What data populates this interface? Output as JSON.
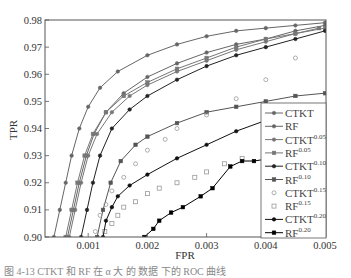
{
  "chart_data": {
    "type": "line",
    "title": "",
    "xlabel": "FPR",
    "ylabel": "TPR",
    "xlim": [
      0.00027,
      0.005
    ],
    "ylim": [
      0.9,
      0.98
    ],
    "grid": false,
    "legend_position": "lower right",
    "x_ticks": [
      "0.001",
      "0.002",
      "0.003",
      "0.004",
      "0.005"
    ],
    "x_tick_values": [
      0.001,
      0.002,
      0.003,
      0.004,
      0.005
    ],
    "y_ticks": [
      "0.90",
      "0.91",
      "0.92",
      "0.93",
      "0.94",
      "0.95",
      "0.96",
      "0.97",
      "0.98"
    ],
    "y_tick_values": [
      0.9,
      0.91,
      0.92,
      0.93,
      0.94,
      0.95,
      0.96,
      0.97,
      0.98
    ],
    "series": [
      {
        "name": "CTKT",
        "sup": "",
        "color": "#666666",
        "marker": "circle",
        "filled": true,
        "line": true,
        "points": [
          [
            0.00042,
            0.9
          ],
          [
            0.00052,
            0.91
          ],
          [
            0.00062,
            0.92
          ],
          [
            0.00072,
            0.93
          ],
          [
            0.00085,
            0.94
          ],
          [
            0.001,
            0.948
          ],
          [
            0.0012,
            0.955
          ],
          [
            0.0015,
            0.961
          ],
          [
            0.002,
            0.967
          ],
          [
            0.0025,
            0.971
          ],
          [
            0.003,
            0.974
          ],
          [
            0.0035,
            0.976
          ],
          [
            0.004,
            0.977
          ],
          [
            0.0045,
            0.978
          ],
          [
            0.005,
            0.979
          ]
        ]
      },
      {
        "name": "RF",
        "sup": "",
        "color": "#666666",
        "marker": "circle",
        "filled": true,
        "line": true,
        "points": [
          [
            0.00065,
            0.9
          ],
          [
            0.00075,
            0.91
          ],
          [
            0.00085,
            0.92
          ],
          [
            0.00097,
            0.93
          ],
          [
            0.0011,
            0.938
          ],
          [
            0.0013,
            0.946
          ],
          [
            0.0016,
            0.953
          ],
          [
            0.002,
            0.959
          ],
          [
            0.0025,
            0.964
          ],
          [
            0.003,
            0.968
          ],
          [
            0.0035,
            0.971
          ],
          [
            0.004,
            0.973
          ],
          [
            0.0045,
            0.976
          ],
          [
            0.005,
            0.978
          ]
        ]
      },
      {
        "name": "CTKT",
        "sup": "0.05",
        "color": "#777777",
        "marker": "circle",
        "filled": true,
        "line": true,
        "points": [
          [
            0.00068,
            0.9
          ],
          [
            0.00078,
            0.91
          ],
          [
            0.00088,
            0.92
          ],
          [
            0.001,
            0.93
          ],
          [
            0.00115,
            0.938
          ],
          [
            0.0014,
            0.946
          ],
          [
            0.0017,
            0.952
          ],
          [
            0.002,
            0.956
          ],
          [
            0.0025,
            0.961
          ],
          [
            0.003,
            0.965
          ],
          [
            0.0035,
            0.969
          ],
          [
            0.004,
            0.972
          ],
          [
            0.0045,
            0.975
          ],
          [
            0.005,
            0.977
          ]
        ]
      },
      {
        "name": "RF",
        "sup": "0.05",
        "color": "#777777",
        "marker": "square",
        "filled": true,
        "line": true,
        "points": [
          [
            0.00062,
            0.9
          ],
          [
            0.00072,
            0.91
          ],
          [
            0.00082,
            0.92
          ],
          [
            0.00094,
            0.93
          ],
          [
            0.00108,
            0.938
          ],
          [
            0.0013,
            0.946
          ],
          [
            0.0016,
            0.952
          ],
          [
            0.002,
            0.957
          ],
          [
            0.0025,
            0.962
          ],
          [
            0.003,
            0.966
          ],
          [
            0.0035,
            0.97
          ],
          [
            0.004,
            0.973
          ],
          [
            0.0045,
            0.975
          ],
          [
            0.0049,
            0.977
          ]
        ]
      },
      {
        "name": "CTKT",
        "sup": "0.10",
        "color": "#222222",
        "marker": "circle",
        "filled": true,
        "line": true,
        "points": [
          [
            0.00088,
            0.9
          ],
          [
            0.00098,
            0.91
          ],
          [
            0.00108,
            0.92
          ],
          [
            0.0012,
            0.93
          ],
          [
            0.0014,
            0.94
          ],
          [
            0.0017,
            0.947
          ],
          [
            0.002,
            0.952
          ],
          [
            0.0025,
            0.958
          ],
          [
            0.003,
            0.963
          ],
          [
            0.0035,
            0.967
          ],
          [
            0.004,
            0.97
          ],
          [
            0.0045,
            0.973
          ],
          [
            0.005,
            0.976
          ]
        ]
      },
      {
        "name": "RF",
        "sup": "0.10",
        "color": "#555555",
        "marker": "square",
        "filled": true,
        "line": true,
        "points": [
          [
            0.00115,
            0.9
          ],
          [
            0.00125,
            0.91
          ],
          [
            0.00138,
            0.92
          ],
          [
            0.00155,
            0.928
          ],
          [
            0.0018,
            0.934
          ],
          [
            0.002,
            0.937
          ],
          [
            0.0025,
            0.942
          ],
          [
            0.003,
            0.946
          ],
          [
            0.0035,
            0.948
          ],
          [
            0.004,
            0.95
          ],
          [
            0.0045,
            0.952
          ],
          [
            0.005,
            0.953
          ]
        ]
      },
      {
        "name": "CTKT",
        "sup": "0.15",
        "color": "#999999",
        "marker": "circle",
        "filled": false,
        "line": false,
        "points": [
          [
            0.00112,
            0.902
          ],
          [
            0.0012,
            0.908
          ],
          [
            0.0013,
            0.912
          ],
          [
            0.0014,
            0.917
          ],
          [
            0.0016,
            0.922
          ],
          [
            0.0018,
            0.927
          ],
          [
            0.002,
            0.932
          ],
          [
            0.0023,
            0.936
          ],
          [
            0.0025,
            0.94
          ],
          [
            0.003,
            0.945
          ],
          [
            0.0035,
            0.951
          ],
          [
            0.004,
            0.958
          ],
          [
            0.0045,
            0.966
          ]
        ]
      },
      {
        "name": "RF",
        "sup": "0.15",
        "color": "#999999",
        "marker": "square",
        "filled": false,
        "line": false,
        "points": [
          [
            0.00128,
            0.902
          ],
          [
            0.0014,
            0.905
          ],
          [
            0.0015,
            0.908
          ],
          [
            0.0016,
            0.911
          ],
          [
            0.0018,
            0.913
          ],
          [
            0.002,
            0.916
          ],
          [
            0.0022,
            0.918
          ],
          [
            0.0025,
            0.92
          ],
          [
            0.0028,
            0.922
          ],
          [
            0.003,
            0.924
          ],
          [
            0.0033,
            0.927
          ],
          [
            0.0036,
            0.929
          ],
          [
            0.004,
            0.931
          ],
          [
            0.0045,
            0.934
          ]
        ]
      },
      {
        "name": "CTKT",
        "sup": "0.20",
        "color": "#111111",
        "marker": "circle",
        "filled": true,
        "line": true,
        "points": [
          [
            0.00125,
            0.9
          ],
          [
            0.0013,
            0.906
          ],
          [
            0.0014,
            0.911
          ],
          [
            0.0015,
            0.915
          ],
          [
            0.0017,
            0.919
          ],
          [
            0.002,
            0.923
          ],
          [
            0.0025,
            0.929
          ],
          [
            0.003,
            0.934
          ],
          [
            0.0035,
            0.939
          ],
          [
            0.004,
            0.943
          ],
          [
            0.0045,
            0.946
          ],
          [
            0.005,
            0.948
          ]
        ]
      },
      {
        "name": "RF",
        "sup": "0.20",
        "color": "#000000",
        "marker": "square",
        "filled": true,
        "line": true,
        "points": [
          [
            0.00195,
            0.9
          ],
          [
            0.0021,
            0.903
          ],
          [
            0.0022,
            0.906
          ],
          [
            0.0024,
            0.909
          ],
          [
            0.0026,
            0.911
          ],
          [
            0.0029,
            0.915
          ],
          [
            0.0031,
            0.918
          ],
          [
            0.0034,
            0.926
          ],
          [
            0.0036,
            0.928
          ],
          [
            0.0038,
            0.928
          ],
          [
            0.0041,
            0.929
          ],
          [
            0.0045,
            0.932
          ],
          [
            0.005,
            0.934
          ]
        ]
      }
    ]
  },
  "caption": "图 4-13   CTKT 和 RF 在 α 大 的 数据 下的 ROC 曲线"
}
